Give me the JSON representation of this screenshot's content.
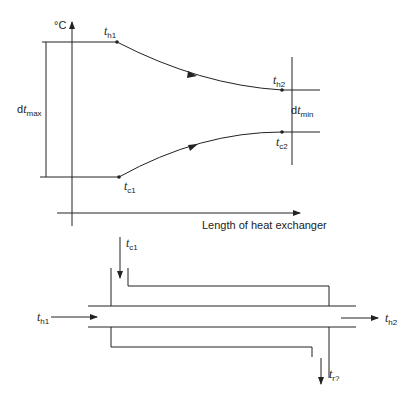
{
  "graph": {
    "y_axis_unit": "°C",
    "x_axis_label": "Length of heat exchanger",
    "delta_max": {
      "prefix": "d",
      "var": "t",
      "sub": "max"
    },
    "delta_min": {
      "prefix": "d",
      "var": "t",
      "sub": "min"
    },
    "points": {
      "th1": {
        "var": "t",
        "sub": "h1"
      },
      "th2": {
        "var": "t",
        "sub": "h2"
      },
      "tc1": {
        "var": "t",
        "sub": "c1"
      },
      "tc2": {
        "var": "t",
        "sub": "c2"
      }
    },
    "curves": [
      {
        "name": "hot-fluid",
        "from": "th1",
        "to": "th2",
        "trend": "decreasing"
      },
      {
        "name": "cold-fluid",
        "from": "tc1",
        "to": "tc2",
        "trend": "increasing"
      }
    ]
  },
  "schematic": {
    "inlet_cold": {
      "var": "t",
      "sub": "c1"
    },
    "inlet_hot": {
      "var": "t",
      "sub": "h1"
    },
    "outlet_hot": {
      "var": "t",
      "sub": "h2"
    },
    "outlet_cold": {
      "var": "t",
      "sub": "r?"
    }
  },
  "colors": {
    "line": "#222222",
    "background": "#ffffff"
  }
}
